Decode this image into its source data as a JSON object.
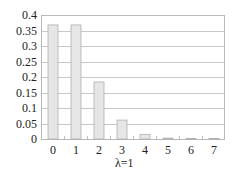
{
  "chart_data": {
    "type": "bar",
    "title": "",
    "xlabel": "λ=1",
    "ylabel": "",
    "categories": [
      "0",
      "1",
      "2",
      "3",
      "4",
      "5",
      "6",
      "7"
    ],
    "values": [
      0.368,
      0.368,
      0.184,
      0.061,
      0.015,
      0.003,
      0.0005,
      0.0001
    ],
    "ylim": [
      0,
      0.4
    ],
    "yticks": [
      "0",
      "0.05",
      "0.1",
      "0.15",
      "0.2",
      "0.25",
      "0.3",
      "0.35",
      "0.4"
    ],
    "grid": true,
    "legend": null,
    "bar_color": "#e6e6e6",
    "bar_edge_color": "#b0b0b0",
    "grid_color": "#c8c8c8"
  }
}
